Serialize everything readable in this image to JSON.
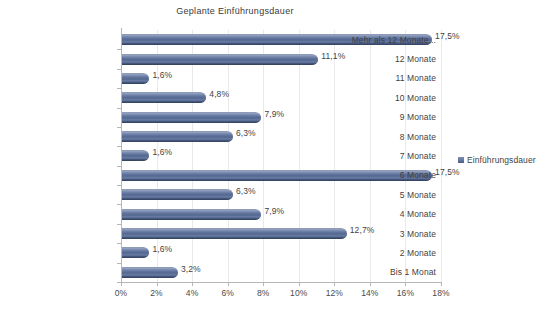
{
  "chart_data": {
    "type": "bar",
    "orientation": "horizontal",
    "title": "Geplante Einführungsdauer",
    "xlabel": "",
    "ylabel": "",
    "xlim": [
      0,
      18
    ],
    "xtick_labels": [
      "0%",
      "2%",
      "4%",
      "6%",
      "8%",
      "10%",
      "12%",
      "14%",
      "16%",
      "18%"
    ],
    "xtick_values": [
      0,
      2,
      4,
      6,
      8,
      10,
      12,
      14,
      16,
      18
    ],
    "grid": true,
    "legend_position": "right",
    "legend": [
      "Einführungsdauer"
    ],
    "categories": [
      "Mehr als 12 Monate...",
      "12 Monate",
      "11 Monate",
      "10 Monate",
      "9 Monate",
      "8 Monate",
      "7 Monate",
      "6 Monate",
      "5 Monate",
      "4 Monate",
      "3 Monate",
      "2 Monate",
      "Bis 1 Monat"
    ],
    "values": [
      17.5,
      11.1,
      1.6,
      4.8,
      7.9,
      6.3,
      1.6,
      17.5,
      6.3,
      7.9,
      12.7,
      1.6,
      3.2
    ],
    "value_labels": [
      "17,5%",
      "11,1%",
      "1,6%",
      "4,8%",
      "7,9%",
      "6,3%",
      "1,6%",
      "17,5%",
      "6,3%",
      "7,9%",
      "12,7%",
      "1,6%",
      "3,2%"
    ],
    "series": [
      {
        "name": "Einführungsdauer",
        "values": [
          17.5,
          11.1,
          1.6,
          4.8,
          7.9,
          6.3,
          1.6,
          17.5,
          6.3,
          7.9,
          12.7,
          1.6,
          3.2
        ]
      }
    ],
    "colors": {
      "bar_light": "#9aa7c4",
      "bar_mid": "#53688f",
      "bar_dark": "#3c4d72",
      "axis": "#b6b6b6",
      "grid": "#e9e9e9",
      "text": "#3f3f3f",
      "background": "#ffffff"
    }
  },
  "legend": {
    "swatch_icon": "legend-square-icon",
    "label": "Einführungsdauer"
  }
}
